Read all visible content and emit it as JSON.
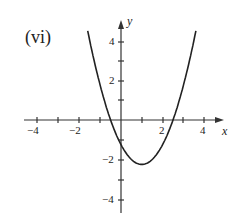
{
  "panel_label": "(vi)",
  "chart_data": {
    "type": "line",
    "title": "(vi)",
    "xlabel": "x",
    "ylabel": "y",
    "xlim": [
      -4.5,
      5
    ],
    "ylim": [
      -4.6,
      4.9
    ],
    "grid": false,
    "x_tick_labels": [
      "-4",
      "-2",
      "2",
      "4"
    ],
    "y_tick_labels": [
      "4",
      "2",
      "-2",
      "-4"
    ],
    "x_ticks": [
      -4,
      -3,
      -2,
      -1,
      1,
      2,
      3,
      4
    ],
    "y_ticks": [
      4,
      3,
      2,
      1,
      -1,
      -2,
      -3,
      -4
    ],
    "series": [
      {
        "name": "parabola",
        "description": "upward-opening parabola, roots ~-0.5 and ~2.5, vertex ~(1,-2.25), y-intercept ~-1.25",
        "x": [
          -1.6,
          -1.5,
          -1,
          -0.5,
          0,
          0.5,
          1,
          1.5,
          2,
          2.5,
          3,
          3.5,
          3.6
        ],
        "y": [
          4.41,
          4.0,
          1.75,
          0,
          -1.25,
          -2.0,
          -2.25,
          -2.0,
          -1.25,
          0,
          1.75,
          4.0,
          4.51
        ]
      }
    ]
  },
  "ticks": {
    "x": {
      "neg4": "−4",
      "neg2": "−2",
      "pos2": "2",
      "pos4": "4"
    },
    "y": {
      "pos4": "4",
      "pos2": "2",
      "neg2": "−2",
      "neg4": "−4"
    }
  },
  "axes": {
    "x_name": "x",
    "y_name": "y"
  }
}
